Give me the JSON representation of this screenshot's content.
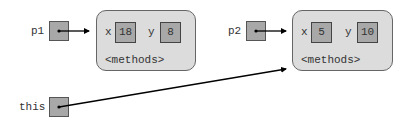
{
  "diagram": {
    "variables": [
      {
        "name": "p1",
        "points_to": "object1"
      },
      {
        "name": "p2",
        "points_to": "object2"
      },
      {
        "name": "this",
        "points_to": "object2"
      }
    ],
    "objects": [
      {
        "id": "object1",
        "fields": [
          {
            "name": "x",
            "value": "18"
          },
          {
            "name": "y",
            "value": "8"
          }
        ],
        "methods_label": "<methods>"
      },
      {
        "id": "object2",
        "fields": [
          {
            "name": "x",
            "value": "5"
          },
          {
            "name": "y",
            "value": "10"
          }
        ],
        "methods_label": "<methods>"
      }
    ],
    "colors": {
      "ref_box_fill": "#a8a8a8",
      "object_fill": "#dcdcdc",
      "border": "#555555",
      "arrow": "#000000"
    }
  }
}
